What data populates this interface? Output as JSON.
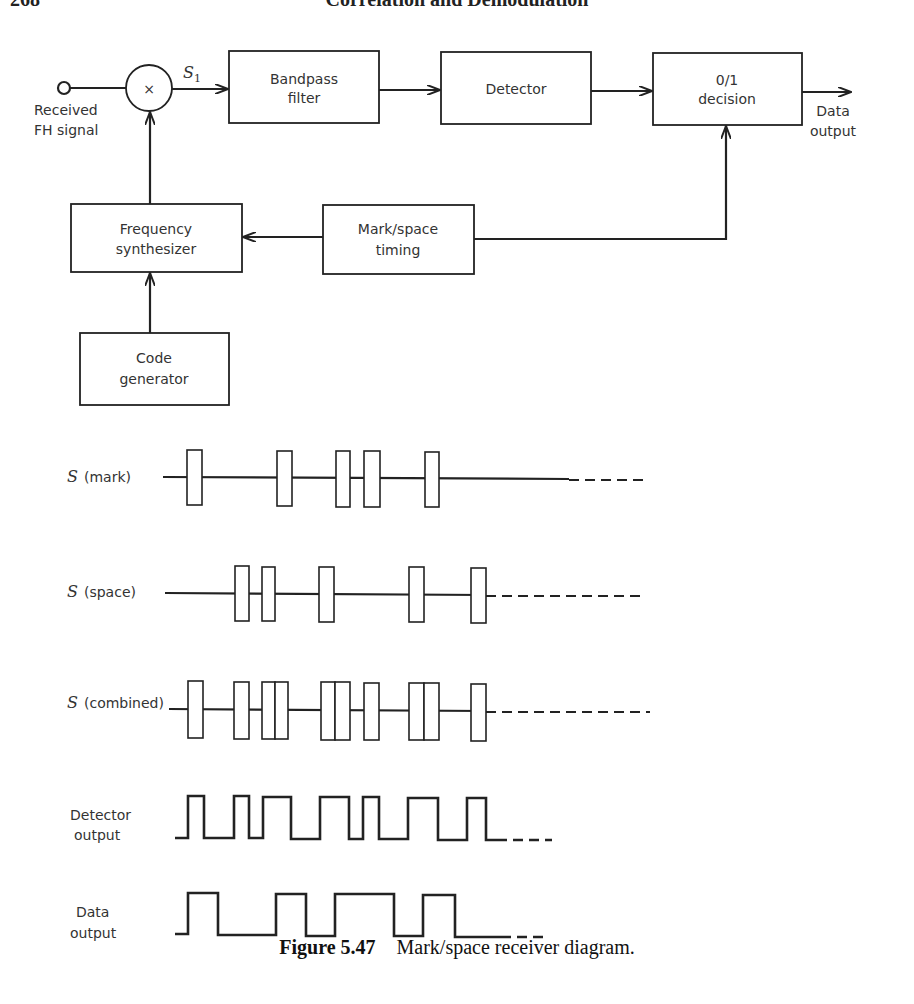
{
  "header": {
    "page_number": "268",
    "running_title": "Correlation and Demodulation"
  },
  "block_diagram": {
    "input_label_line1": "Received",
    "input_label_line2": "FH signal",
    "mixer_symbol": "×",
    "signal_label": "S",
    "signal_subscript": "1",
    "blocks": {
      "bandpass_filter": [
        "Bandpass",
        "filter"
      ],
      "detector": [
        "Detector"
      ],
      "decision": [
        "0/1",
        "decision"
      ],
      "frequency_synthesizer": [
        "Frequency",
        "synthesizer"
      ],
      "mark_space_timing": [
        "Mark/space",
        "timing"
      ],
      "code_generator": [
        "Code",
        "generator"
      ]
    },
    "output_label_line1": "Data",
    "output_label_line2": "output"
  },
  "waveforms": {
    "mark": {
      "label_symbol": "S",
      "label_text": "(mark)"
    },
    "space": {
      "label_symbol": "S",
      "label_text": "(space)"
    },
    "combined": {
      "label_symbol": "S",
      "label_text": "(combined)"
    },
    "detector": {
      "label_line1": "Detector",
      "label_line2": "output"
    },
    "data": {
      "label_line1": "Data",
      "label_line2": "output"
    }
  },
  "caption": {
    "figure_number": "Figure 5.47",
    "text": "Mark/space receiver diagram."
  }
}
